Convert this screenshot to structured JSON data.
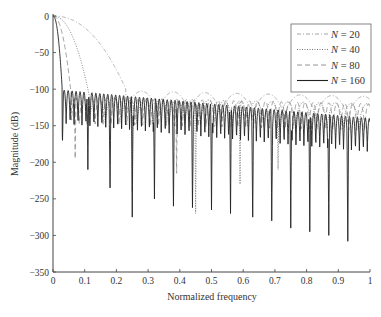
{
  "chart_data": {
    "type": "line",
    "title": "",
    "xlabel": "Normalized frequency",
    "ylabel": "Magnitude (dB)",
    "xlim": [
      0,
      1
    ],
    "ylim": [
      -350,
      0
    ],
    "xticks": [
      0,
      0.1,
      0.2,
      0.3,
      0.4,
      0.5,
      0.6,
      0.7,
      0.8,
      0.9,
      1
    ],
    "xtick_labels": [
      "0",
      "0.1",
      "0.2",
      "0.3",
      "0.4",
      "0.5",
      "0.6",
      "0.7",
      "0.8",
      "0.9",
      "1"
    ],
    "yticks": [
      0,
      -50,
      -100,
      -150,
      -200,
      -250,
      -300,
      -350
    ],
    "ytick_labels": [
      "0",
      "−50",
      "−100",
      "−150",
      "−200",
      "−250",
      "−300",
      "−350"
    ],
    "grid": false,
    "legend_position": "upper right",
    "series": [
      {
        "name": "N = 20",
        "N": 20,
        "style": "dash-dot",
        "color": "#9a9a9a",
        "sidelobe_db": -100,
        "mainlobe_halfwidth": 0.23,
        "deep_nulls": []
      },
      {
        "name": "N = 40",
        "N": 40,
        "style": "dotted",
        "color": "#666666",
        "sidelobe_db": -110,
        "mainlobe_halfwidth": 0.115,
        "deep_nulls": [
          0.25,
          0.45,
          0.59,
          0.71
        ]
      },
      {
        "name": "N = 80",
        "N": 80,
        "style": "dashed",
        "color": "#8a8a8a",
        "sidelobe_db": -110,
        "mainlobe_halfwidth": 0.058,
        "deep_nulls": [
          0.07,
          0.39
        ]
      },
      {
        "name": "N = 160",
        "N": 160,
        "style": "solid",
        "color": "#222222",
        "sidelobe_db": -100,
        "mainlobe_halfwidth": 0.029,
        "deep_nulls": [
          0.03,
          0.11,
          0.18,
          0.25,
          0.32,
          0.38,
          0.44,
          0.5,
          0.56,
          0.63,
          0.69,
          0.75,
          0.81,
          0.87,
          0.93
        ]
      }
    ],
    "deep_null_depths": {
      "N = 160": [
        -170,
        -210,
        -235,
        -275,
        -250,
        -260,
        -262,
        -265,
        -270,
        -275,
        -280,
        -290,
        -295,
        -300,
        -308
      ],
      "N = 40": [
        -240,
        -270,
        -230,
        -210
      ],
      "N = 80": [
        -195,
        -215
      ]
    }
  },
  "legend": {
    "items": [
      {
        "prefix": "N",
        "suffix": " = 20"
      },
      {
        "prefix": "N",
        "suffix": " = 40"
      },
      {
        "prefix": "N",
        "suffix": " = 80"
      },
      {
        "prefix": "N",
        "suffix": " = 160"
      }
    ]
  }
}
